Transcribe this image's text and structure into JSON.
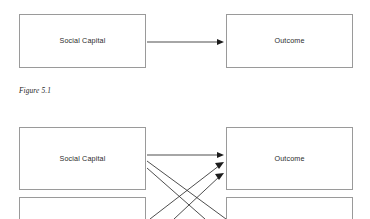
{
  "document": {
    "background_color": "#ffffff",
    "box_border_color": "#9a9a9a",
    "edge_color": "#2e2e2e",
    "text_color": "#2b2b2b"
  },
  "figures": [
    {
      "id": "figure-5-1",
      "caption": "Figure 5.1",
      "nodes": [
        {
          "id": "social-capital",
          "label": "Social Capital",
          "x": 19,
          "y": 14,
          "w": 127,
          "h": 54
        },
        {
          "id": "outcome",
          "label": "Outcome",
          "x": 226,
          "y": 14,
          "w": 127,
          "h": 54
        }
      ],
      "edges": [
        {
          "id": "social-capital-to-outcome",
          "from": "social-capital",
          "to": "outcome",
          "x1": 147,
          "y1": 42,
          "x2": 224,
          "y2": 42
        }
      ]
    },
    {
      "id": "figure-5-2",
      "caption": "",
      "nodes": [
        {
          "id": "social-capital-2",
          "label": "Social Capital",
          "x": 19,
          "y": 127,
          "w": 127,
          "h": 63
        },
        {
          "id": "outcome-2",
          "label": "Outcome",
          "x": 226,
          "y": 127,
          "w": 127,
          "h": 63
        },
        {
          "id": "node-bottom-left",
          "label": "",
          "x": 19,
          "y": 197,
          "w": 127,
          "h": 30
        },
        {
          "id": "node-bottom-right",
          "label": "",
          "x": 226,
          "y": 197,
          "w": 127,
          "h": 30
        }
      ],
      "edges": [
        {
          "id": "sc2-to-outcome2-straight",
          "from": "social-capital-2",
          "to": "outcome-2",
          "x1": 147,
          "y1": 155,
          "x2": 224,
          "y2": 155
        },
        {
          "id": "sc2-to-outcome2-diag-a",
          "from": "social-capital-2",
          "to": "outcome-2",
          "x1": 147,
          "y1": 162,
          "x2": 224,
          "y2": 219
        },
        {
          "id": "sc2-to-outcome2-diag-b",
          "from": "social-capital-2",
          "to": "outcome-2",
          "x1": 147,
          "y1": 169,
          "x2": 203,
          "y2": 219
        },
        {
          "id": "bottom-to-outcome2-diag-c",
          "from": "node-bottom-left",
          "to": "outcome-2",
          "x1": 152,
          "y1": 219,
          "x2": 224,
          "y2": 163
        },
        {
          "id": "bottom-to-outcome2-diag-d",
          "from": "node-bottom-left",
          "to": "outcome-2",
          "x1": 176,
          "y1": 219,
          "x2": 224,
          "y2": 174
        }
      ]
    }
  ],
  "captions": {
    "figure_5_1": "Figure 5.1"
  }
}
